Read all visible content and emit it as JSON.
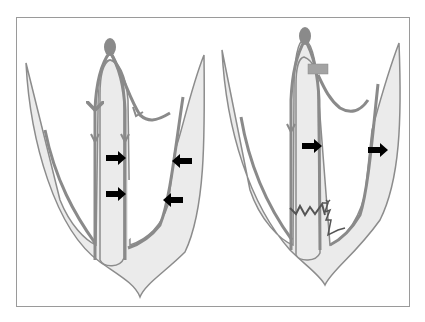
{
  "figure": {
    "type": "medical-diagram",
    "panels": [
      {
        "id": "left",
        "description": "normal conduction",
        "elements": [
          "sa-node",
          "conduction-pathways",
          "septum",
          "left-ventricle-wall",
          "right-ventricle-wall",
          "contraction-arrows"
        ],
        "arrows": [
          {
            "direction": "right",
            "location": "septum-upper"
          },
          {
            "direction": "right",
            "location": "septum-lower"
          },
          {
            "direction": "left",
            "location": "free-wall-upper"
          },
          {
            "direction": "left",
            "location": "free-wall-lower"
          }
        ]
      },
      {
        "id": "right",
        "description": "conduction block",
        "elements": [
          "sa-node",
          "block-bar",
          "conduction-pathways",
          "septum",
          "zigzag-delayed-conduction",
          "contraction-arrows"
        ],
        "arrows": [
          {
            "direction": "right",
            "location": "septum"
          },
          {
            "direction": "right",
            "location": "free-wall"
          }
        ]
      }
    ],
    "colors": {
      "outline": "#8c8c8c",
      "fill": "#ebebeb",
      "pathway": "#8a8a8a",
      "arrow": "#000000",
      "node": "#8a8a8a",
      "block": "#a0a0a0",
      "zigzag": "#555555",
      "frame": "#9a9a9a"
    }
  }
}
